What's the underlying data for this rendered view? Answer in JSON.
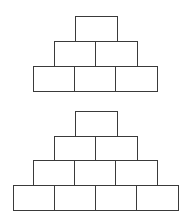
{
  "diagram": {
    "title": "",
    "pyramids": [
      {
        "name": "pyramid-3-rows",
        "rows": [
          {
            "boxes": 1,
            "y": 16,
            "x": 75
          },
          {
            "boxes": 2,
            "y": 41,
            "x": 54
          },
          {
            "boxes": 3,
            "y": 66,
            "x": 33
          }
        ]
      },
      {
        "name": "pyramid-4-rows",
        "rows": [
          {
            "boxes": 1,
            "y": 111,
            "x": 75
          },
          {
            "boxes": 2,
            "y": 136,
            "x": 54
          },
          {
            "boxes": 3,
            "y": 160,
            "x": 33
          },
          {
            "boxes": 4,
            "y": 185,
            "x": 13
          }
        ]
      }
    ],
    "box_width": 42,
    "box_height": 25,
    "stroke_color": "#3a3a3a"
  }
}
